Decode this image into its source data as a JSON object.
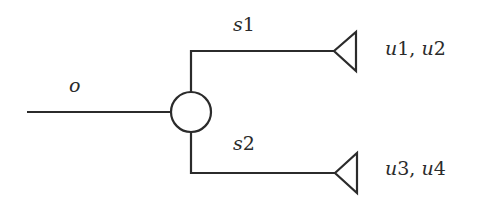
{
  "diagram": {
    "type": "tree-network",
    "colors": {
      "stroke": "#2b2b2b",
      "background": "#ffffff"
    },
    "nodes": {
      "origin": {
        "label": "o"
      },
      "junction": {
        "shape": "circle"
      },
      "sink_top": {
        "shape": "triangle",
        "label": "u1, u2"
      },
      "sink_bottom": {
        "shape": "triangle",
        "label": "u3, u4"
      }
    },
    "edges": {
      "incoming": {
        "label": "o"
      },
      "branch_top": {
        "label": "s1"
      },
      "branch_bottom": {
        "label": "s2"
      }
    },
    "labels": {
      "o": "o",
      "s1_letter": "s",
      "s1_num": "1",
      "s2_letter": "s",
      "s2_num": "2",
      "top_users": {
        "u_a": "u",
        "n_a": "1",
        "sep": ", ",
        "u_b": "u",
        "n_b": "2"
      },
      "bottom_users": {
        "u_a": "u",
        "n_a": "3",
        "sep": ", ",
        "u_b": "u",
        "n_b": "4"
      }
    }
  }
}
